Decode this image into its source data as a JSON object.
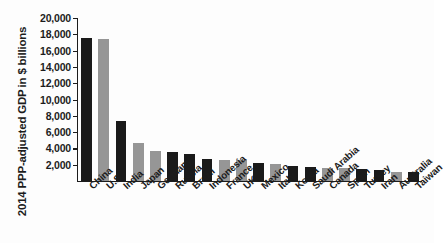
{
  "chart_data": {
    "type": "bar",
    "title": "",
    "subtitle": "",
    "xlabel": "",
    "ylabel": "2014 PPP-adjusted GDP in $ billions",
    "ylabel_lines": [
      "2014 PPP-adjusted GDP",
      "in $ billions"
    ],
    "ylim": [
      0,
      20000
    ],
    "ytick_labels": [
      "20,000",
      "18,000",
      "16,000",
      "14,000",
      "12,000",
      "10,000",
      "8,000",
      "6,000",
      "4,000",
      "2,000"
    ],
    "ytick_values": [
      20000,
      18000,
      16000,
      14000,
      12000,
      10000,
      8000,
      6000,
      4000,
      2000
    ],
    "grid": false,
    "legend": false,
    "legend_position": "none",
    "orientation": "vertical",
    "categories": [
      "China",
      "U.S.",
      "India",
      "Japan",
      "Germany",
      "Russia",
      "Brazil",
      "Indonesia",
      "France",
      "UK",
      "Mexico",
      "Italy",
      "Korea",
      "Saudi Arabia",
      "Canada",
      "Spain",
      "Turkey",
      "Iran",
      "Australia",
      "Taiwan"
    ],
    "values": [
      17600,
      17400,
      7400,
      4700,
      3700,
      3600,
      3300,
      2700,
      2600,
      2550,
      2150,
      2100,
      1800,
      1700,
      1600,
      1550,
      1500,
      1350,
      1100,
      1050
    ],
    "bar_colors": [
      "#1a1a1a",
      "#969696",
      "#1a1a1a",
      "#969696",
      "#969696",
      "#1a1a1a",
      "#1a1a1a",
      "#1a1a1a",
      "#969696",
      "#969696",
      "#1a1a1a",
      "#969696",
      "#1a1a1a",
      "#1a1a1a",
      "#969696",
      "#969696",
      "#1a1a1a",
      "#1a1a1a",
      "#969696",
      "#1a1a1a"
    ],
    "palette": {
      "dark": "#1a1a1a",
      "light": "#969696",
      "axis": "#1c1c1c",
      "background": "#fdfdfd"
    }
  }
}
